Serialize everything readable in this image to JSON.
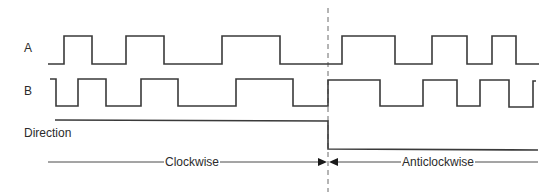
{
  "diagram": {
    "type": "timing-diagram",
    "signals": [
      {
        "name": "A",
        "label_y": 44,
        "high_y": 36,
        "low_y": 64,
        "points": "48,64 64,64 64,36 92,36 92,64 126,64 126,36 164,36 164,64 222,64 222,36 280,36 280,64 342,64 342,36 395,36 395,64 432,64 432,36 467,36 467,64 492,64 492,36 516,36 516,64 539,64"
      },
      {
        "name": "B",
        "label_y": 87,
        "high_y": 79,
        "low_y": 106,
        "points": "50,79 56,79 56,106 78,106 78,79 106,79 106,106 141,106 141,79 178,79 178,106 236,106 236,79 293,79 293,106 328,106 328,80 380,80 380,106 423,106 423,80 457,80 457,106 480,106 480,80 509,80 509,107 533,107 533,81 536,81"
      },
      {
        "name": "Direction",
        "label_y": 127,
        "points": "55,120 328,121 328,149 538,150"
      }
    ],
    "labels": {
      "a": "A",
      "b": "B",
      "direction": "Direction",
      "clockwise": "Clockwise",
      "anticlockwise": "Anticlockwise"
    },
    "divider_x": 328,
    "arrow_line_y": 162,
    "colors": {
      "line": "#3a3a3a",
      "dash": "#6a6a6a",
      "text": "#2b2b2b"
    }
  }
}
